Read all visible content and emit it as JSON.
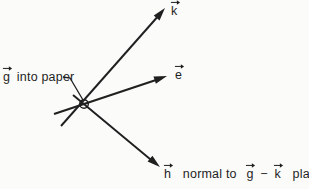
{
  "diagram": {
    "background_color": "#fbfbfa",
    "ink_color": "#1f1f1f",
    "origin_symbol": "circled-cross-vector-into-page",
    "vectors": {
      "k_label": "k",
      "e_label": "e",
      "g_label": "g",
      "h_label": "h"
    },
    "annotations": {
      "g_into_paper": "into paper",
      "h_normal_to": "normal to",
      "minus": "−",
      "plane": "plane"
    }
  }
}
